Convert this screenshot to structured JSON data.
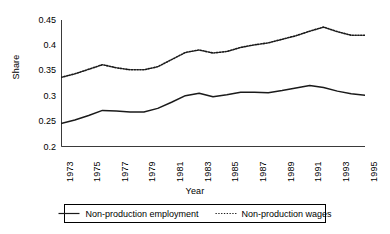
{
  "chart_data": {
    "type": "line",
    "title": "",
    "xlabel": "Year",
    "ylabel": "Share",
    "xlim": [
      1973,
      1995
    ],
    "ylim": [
      0.2,
      0.45
    ],
    "yticks": [
      "0.2",
      "0.25",
      "0.3",
      "0.35",
      "0.4",
      "0.45"
    ],
    "ytick_values": [
      0.2,
      0.25,
      0.3,
      0.35,
      0.4,
      0.45
    ],
    "xticks": [
      "1973",
      "1975",
      "1977",
      "1979",
      "1981",
      "1983",
      "1985",
      "1987",
      "1989",
      "1991",
      "1993",
      "1995"
    ],
    "xtick_values": [
      1973,
      1975,
      1977,
      1979,
      1981,
      1983,
      1985,
      1987,
      1989,
      1991,
      1993,
      1995
    ],
    "minor_xticks_every": 1,
    "grid": false,
    "legend_position": "bottom",
    "x": [
      1973,
      1974,
      1975,
      1976,
      1977,
      1978,
      1979,
      1980,
      1981,
      1982,
      1983,
      1984,
      1985,
      1986,
      1987,
      1988,
      1989,
      1990,
      1991,
      1992,
      1993,
      1994,
      1995
    ],
    "series": [
      {
        "name": "Non-production employment",
        "style": "solid",
        "color": "#1a1a1a",
        "values": [
          0.246,
          0.253,
          0.262,
          0.272,
          0.271,
          0.269,
          0.269,
          0.276,
          0.288,
          0.301,
          0.306,
          0.299,
          0.303,
          0.308,
          0.308,
          0.307,
          0.311,
          0.316,
          0.321,
          0.317,
          0.31,
          0.305,
          0.302
        ]
      },
      {
        "name": "Non-production wages",
        "style": "dotted",
        "color": "#1a1a1a",
        "values": [
          0.337,
          0.344,
          0.353,
          0.362,
          0.356,
          0.352,
          0.352,
          0.358,
          0.372,
          0.386,
          0.391,
          0.385,
          0.388,
          0.396,
          0.401,
          0.405,
          0.412,
          0.419,
          0.428,
          0.436,
          0.427,
          0.42,
          0.42
        ]
      }
    ]
  },
  "legend": {
    "items": [
      {
        "label": "Non-production employment",
        "style": "solid"
      },
      {
        "label": "Non-production wages",
        "style": "dotted"
      }
    ]
  }
}
